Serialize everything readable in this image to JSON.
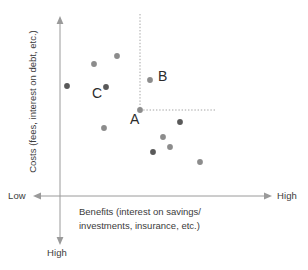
{
  "chart_data": {
    "type": "scatter",
    "title": "",
    "xlabel": "Benefits (interest on savings/ investments, insurance, etc.)",
    "ylabel": "Costs (fees, interest on debt, etc.)",
    "xlabel_line1": "Benefits (interest on savings/",
    "xlabel_line2": "investments, insurance, etc.)",
    "x_axis_low_label": "Low",
    "x_axis_high_label": "High",
    "y_axis_high_label": "High",
    "x_axis_direction": "Low on left, High on right",
    "y_axis_direction": "High cost downward (arrow points down to High)",
    "grid": false,
    "legend": false,
    "point_color": "#8c8c8c",
    "point_color_dark": "#595959",
    "axis_color": "#9a9a9a",
    "guide_line_color": "#9a9a9a",
    "annotations": [
      {
        "label": "A",
        "x": 140,
        "y": 110,
        "note": "reference point at corner of dashed guide lines"
      },
      {
        "label": "B",
        "x": 150,
        "y": 80,
        "note": "higher cost, similar benefit"
      },
      {
        "label": "C",
        "x": 106,
        "y": 87,
        "note": "lower benefit, similar cost"
      }
    ],
    "guide_lines": [
      {
        "orientation": "vertical",
        "x": 140,
        "y_from": 14,
        "y_to": 110,
        "style": "dotted"
      },
      {
        "orientation": "horizontal",
        "y": 110,
        "x_from": 140,
        "x_to": 215,
        "style": "dotted"
      }
    ],
    "points": [
      {
        "x": 117,
        "y": 56,
        "shade": "mid"
      },
      {
        "x": 94,
        "y": 64,
        "shade": "mid"
      },
      {
        "x": 67,
        "y": 86,
        "shade": "dark"
      },
      {
        "x": 106,
        "y": 87,
        "shade": "dark",
        "label": "C"
      },
      {
        "x": 150,
        "y": 80,
        "shade": "mid",
        "label": "B"
      },
      {
        "x": 140,
        "y": 110,
        "shade": "mid",
        "label": "A"
      },
      {
        "x": 104,
        "y": 128,
        "shade": "mid"
      },
      {
        "x": 180,
        "y": 122,
        "shade": "dark"
      },
      {
        "x": 163,
        "y": 137,
        "shade": "mid"
      },
      {
        "x": 170,
        "y": 147,
        "shade": "mid"
      },
      {
        "x": 153,
        "y": 152,
        "shade": "dark"
      },
      {
        "x": 200,
        "y": 162,
        "shade": "mid"
      }
    ],
    "axes": {
      "x_axis": {
        "y": 196,
        "x_from": 33,
        "x_to": 272,
        "arrow_left": true,
        "arrow_right": true
      },
      "y_axis": {
        "x": 60,
        "y_from": 16,
        "y_to": 245,
        "arrow_up": true,
        "arrow_down": true
      }
    }
  }
}
